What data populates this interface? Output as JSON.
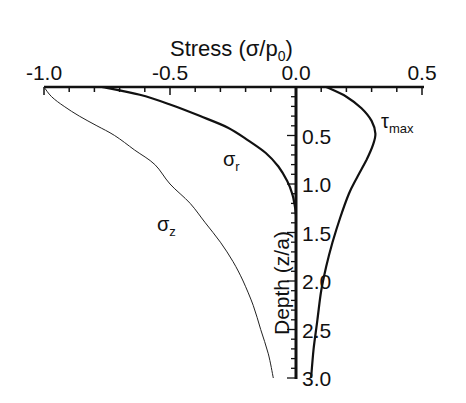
{
  "chart_data": {
    "type": "line",
    "title": "",
    "xlabel": "Stress (σ/p0)",
    "xlabel_main": "Stress (σ/p",
    "xlabel_sub": "0",
    "xlabel_close": ")",
    "ylabel": "Depth (z/a)",
    "xlim": [
      -1.0,
      0.5
    ],
    "ylim": [
      0,
      3.0
    ],
    "y_inverted": true,
    "x_axis_position": "top",
    "y_axis_position": "x=0",
    "grid": false,
    "x_ticks": [
      -1.0,
      -0.5,
      0.0,
      0.5
    ],
    "x_tick_labels": [
      "-1.0",
      "-0.5",
      "0.0",
      "0.5"
    ],
    "y_ticks": [
      0.5,
      1.0,
      1.5,
      2.0,
      2.5,
      3.0
    ],
    "y_tick_labels": [
      "0.5",
      "1.0",
      "1.5",
      "2.0",
      "2.5",
      "3.0"
    ],
    "series": [
      {
        "name": "σz",
        "label_main": "σ",
        "label_sub": "z",
        "line_width": 1,
        "points": [
          [
            -1.0,
            0.0
          ],
          [
            -0.97,
            0.1
          ],
          [
            -0.92,
            0.2
          ],
          [
            -0.86,
            0.3
          ],
          [
            -0.79,
            0.4
          ],
          [
            -0.72,
            0.5
          ],
          [
            -0.64,
            0.65
          ],
          [
            -0.56,
            0.8
          ],
          [
            -0.5,
            1.0
          ],
          [
            -0.42,
            1.2
          ],
          [
            -0.36,
            1.4
          ],
          [
            -0.3,
            1.6
          ],
          [
            -0.25,
            1.8
          ],
          [
            -0.21,
            2.0
          ],
          [
            -0.17,
            2.25
          ],
          [
            -0.14,
            2.5
          ],
          [
            -0.11,
            2.75
          ],
          [
            -0.09,
            3.0
          ]
        ]
      },
      {
        "name": "σr",
        "label_main": "σ",
        "label_sub": "r",
        "line_width": 2.2,
        "points": [
          [
            -0.77,
            0.0
          ],
          [
            -0.62,
            0.08
          ],
          [
            -0.5,
            0.18
          ],
          [
            -0.38,
            0.3
          ],
          [
            -0.27,
            0.42
          ],
          [
            -0.19,
            0.55
          ],
          [
            -0.12,
            0.68
          ],
          [
            -0.07,
            0.82
          ],
          [
            -0.035,
            0.97
          ],
          [
            -0.015,
            1.1
          ],
          [
            -0.005,
            1.22
          ],
          [
            0.0,
            1.32
          ]
        ]
      },
      {
        "name": "τmax",
        "label_main": "τ",
        "label_sub": "max",
        "line_width": 2.2,
        "points": [
          [
            0.12,
            0.0
          ],
          [
            0.2,
            0.1
          ],
          [
            0.26,
            0.22
          ],
          [
            0.3,
            0.35
          ],
          [
            0.315,
            0.48
          ],
          [
            0.305,
            0.6
          ],
          [
            0.28,
            0.75
          ],
          [
            0.245,
            0.92
          ],
          [
            0.21,
            1.1
          ],
          [
            0.175,
            1.35
          ],
          [
            0.145,
            1.6
          ],
          [
            0.12,
            1.85
          ],
          [
            0.1,
            2.1
          ],
          [
            0.085,
            2.4
          ],
          [
            0.07,
            2.7
          ],
          [
            0.06,
            3.0
          ]
        ]
      }
    ]
  }
}
